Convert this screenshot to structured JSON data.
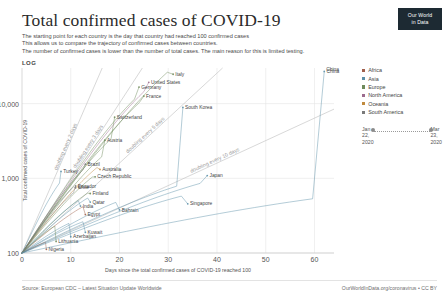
{
  "header": {
    "title": "Total confirmed cases of COVID-19",
    "subtitle_lines": [
      "The starting point for each country is the day that country had reached 100 confirmed cases",
      "This allows us to compare the trajectory of confirmed cases between countries.",
      "The number of confirmed cases is lower than the number of total cases. The main reason for this is limited testing."
    ],
    "scale_label": "LOG",
    "logo_line1": "Our World",
    "logo_line2": "in Data"
  },
  "legend": {
    "items": [
      {
        "label": "Africa",
        "color": "#a05f4b"
      },
      {
        "label": "Asia",
        "color": "#5b8fa8"
      },
      {
        "label": "Europe",
        "color": "#6e8a5a"
      },
      {
        "label": "North America",
        "color": "#9c6b8e"
      },
      {
        "label": "Oceania",
        "color": "#c08a3e"
      },
      {
        "label": "South America",
        "color": "#7a7a7a"
      }
    ]
  },
  "time_slider": {
    "start_date": "Jan\n22,\n2020",
    "end_date": "Mar\n23,\n2020"
  },
  "footer": {
    "source": "Source: European CDC – Latest Situation Update Worldwide",
    "credit": "OurWorldInData.org/coronavirus • CC BY"
  },
  "chart_data": {
    "type": "line",
    "title": "Total confirmed cases of COVID-19",
    "xlabel": "Days since the total confirmed cases of COVID-19 reached 100",
    "ylabel": "Total confirmed cases of COVID-19",
    "yscale": "log",
    "xlim": [
      0,
      64
    ],
    "ylim": [
      100,
      30000
    ],
    "xticks": [
      "0",
      "10",
      "20",
      "30",
      "40",
      "50",
      "60"
    ],
    "xtick_values": [
      0,
      10,
      20,
      30,
      40,
      50,
      60
    ],
    "yticks": [
      "100",
      "1,000",
      "10,000"
    ],
    "ytick_values": [
      100,
      1000,
      10000
    ],
    "grid": true,
    "legend_position": "right",
    "reference_lines": [
      {
        "label": "doubling every 2 days",
        "doubling_days": 2
      },
      {
        "label": "doubling every 3 days",
        "doubling_days": 3
      },
      {
        "label": "doubling every 5 days",
        "doubling_days": 5
      },
      {
        "label": "doubling every 10 days",
        "doubling_days": 10
      }
    ],
    "annotations": [
      {
        "label": "China",
        "x": 62,
        "y": 27000
      }
    ],
    "series": [
      {
        "name": "Italy",
        "continent": "Europe",
        "doubling_days": 3.3,
        "days": 31,
        "end_value": 24747
      },
      {
        "name": "United States",
        "continent": "North America",
        "doubling_days": 3.1,
        "days": 26,
        "end_value": 19273
      },
      {
        "name": "Germany",
        "continent": "Europe",
        "doubling_days": 3.0,
        "days": 24,
        "end_value": 16662
      },
      {
        "name": "France",
        "continent": "Europe",
        "doubling_days": 3.2,
        "days": 25,
        "end_value": 12612
      },
      {
        "name": "South Korea",
        "continent": "Asia",
        "doubling_days": 9.5,
        "days": 33,
        "end_value": 8897
      },
      {
        "name": "Switzerland",
        "continent": "Europe",
        "doubling_days": 3.2,
        "days": 19,
        "end_value": 6575
      },
      {
        "name": "Austria",
        "continent": "Europe",
        "doubling_days": 3.4,
        "days": 17,
        "end_value": 3244
      },
      {
        "name": "Brazil",
        "continent": "South America",
        "doubling_days": 3.0,
        "days": 13,
        "end_value": 1546
      },
      {
        "name": "Australia",
        "continent": "Oceania",
        "doubling_days": 3.6,
        "days": 16,
        "end_value": 1314
      },
      {
        "name": "Turkey",
        "continent": "Asia",
        "doubling_days": 2.2,
        "days": 8,
        "end_value": 1236
      },
      {
        "name": "Czech Republic",
        "continent": "Europe",
        "doubling_days": 3.8,
        "days": 15,
        "end_value": 1047
      },
      {
        "name": "Ecuador",
        "continent": "South America",
        "doubling_days": 3.5,
        "days": 11,
        "end_value": 789
      },
      {
        "name": "Chile",
        "continent": "South America",
        "doubling_days": 3.2,
        "days": 11,
        "end_value": 746
      },
      {
        "name": "Finland",
        "continent": "Europe",
        "doubling_days": 4.5,
        "days": 14,
        "end_value": 626
      },
      {
        "name": "India",
        "continent": "Asia",
        "doubling_days": 4.4,
        "days": 12,
        "end_value": 425
      },
      {
        "name": "Qatar",
        "continent": "Asia",
        "doubling_days": 4.9,
        "days": 14,
        "end_value": 481
      },
      {
        "name": "Egypt",
        "continent": "Africa",
        "doubling_days": 5.4,
        "days": 13,
        "end_value": 327
      },
      {
        "name": "Bahrain",
        "continent": "Asia",
        "doubling_days": 7.6,
        "days": 20,
        "end_value": 377
      },
      {
        "name": "Azerbaijan",
        "continent": "Asia",
        "doubling_days": 6.5,
        "days": 10,
        "end_value": 165
      },
      {
        "name": "Kuwait",
        "continent": "Asia",
        "doubling_days": 8.0,
        "days": 13,
        "end_value": 189
      },
      {
        "name": "Lithuania",
        "continent": "Europe",
        "doubling_days": 5.0,
        "days": 7,
        "end_value": 143
      },
      {
        "name": "Nigeria",
        "continent": "Africa",
        "doubling_days": 9.0,
        "days": 5,
        "end_value": 112
      },
      {
        "name": "Japan",
        "continent": "Asia",
        "doubling_days": 10.5,
        "days": 38,
        "end_value": 1089
      },
      {
        "name": "Singapore",
        "continent": "Asia",
        "doubling_days": 11.5,
        "days": 34,
        "end_value": 455
      },
      {
        "name": "China",
        "continent": "Asia",
        "doubling_days": 22.0,
        "days": 62,
        "end_value": 27000
      }
    ]
  }
}
